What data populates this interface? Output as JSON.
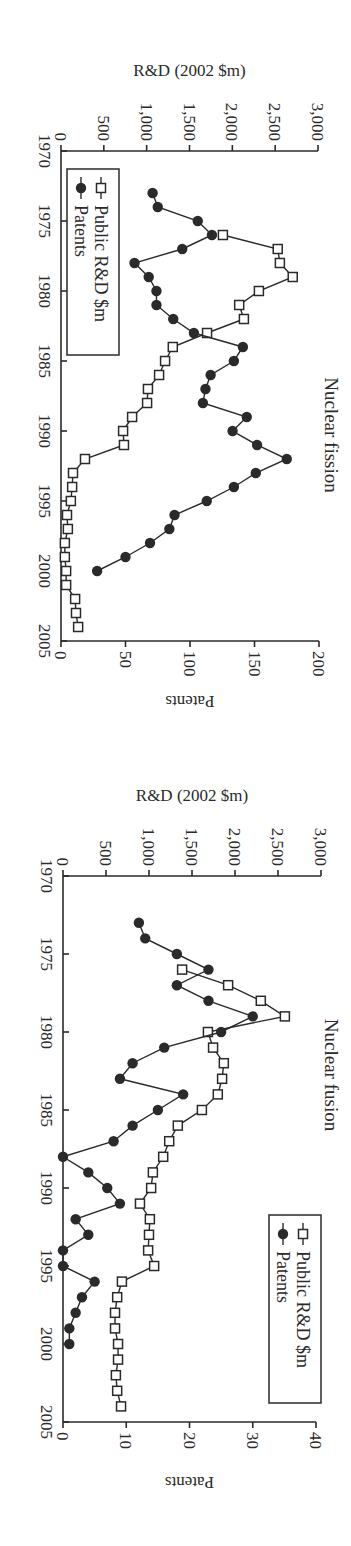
{
  "figure": {
    "panels": [
      "Nuclear fission",
      "Nuclear fusion"
    ]
  },
  "chart_data": [
    {
      "type": "line",
      "title": "Nuclear fission",
      "xlabel": "",
      "ylabel": "R&D (2002 $m)",
      "y2label": "Patents",
      "xlim": [
        1970,
        2005
      ],
      "ylim": [
        0,
        3000
      ],
      "y2lim": [
        0,
        200
      ],
      "xticks": [
        1970,
        1975,
        1980,
        1985,
        1990,
        1995,
        2000,
        2005
      ],
      "yticks": [
        0,
        500,
        1000,
        1500,
        2000,
        2500,
        3000
      ],
      "yticklabels": [
        "0",
        "500",
        "1,000",
        "1,500",
        "2,000",
        "2,500",
        "3,000"
      ],
      "y2ticks": [
        0,
        50,
        100,
        150,
        200
      ],
      "legend": [
        "Public R&D $m",
        "Patents"
      ],
      "legend_position": "lower-left",
      "grid": false,
      "series": [
        {
          "name": "Public R&D $m",
          "axis": "left",
          "marker": "open-square",
          "x": [
            1976,
            1977,
            1978,
            1979,
            1980,
            1981,
            1982,
            1983,
            1984,
            1985,
            1986,
            1987,
            1988,
            1989,
            1990,
            1991,
            1992,
            1993,
            1994,
            1995,
            1996,
            1997,
            1998,
            1999,
            2000,
            2001,
            2002,
            2003,
            2004
          ],
          "values": [
            1890,
            2530,
            2555,
            2705,
            2310,
            2080,
            2135,
            1705,
            1305,
            1215,
            1145,
            1015,
            1005,
            830,
            725,
            735,
            280,
            140,
            130,
            115,
            70,
            80,
            45,
            45,
            60,
            60,
            165,
            175,
            200
          ]
        },
        {
          "name": "Patents",
          "axis": "right",
          "marker": "filled-circle",
          "x": [
            1973,
            1974,
            1975,
            1976,
            1977,
            1978,
            1979,
            1980,
            1981,
            1982,
            1983,
            1984,
            1985,
            1986,
            1987,
            1988,
            1989,
            1990,
            1991,
            1992,
            1993,
            1994,
            1995,
            1996,
            1997,
            1998,
            1999,
            2000
          ],
          "values": [
            71,
            75,
            106,
            117,
            94,
            57,
            68,
            74,
            74,
            87,
            103,
            141,
            134,
            116,
            112,
            110,
            144,
            133,
            152,
            175,
            151,
            134,
            113,
            88,
            84,
            69,
            50,
            28
          ]
        }
      ]
    },
    {
      "type": "line",
      "title": "Nuclear fusion",
      "xlabel": "",
      "ylabel": "R&D (2002 $m)",
      "y2label": "Patents",
      "xlim": [
        1970,
        2005
      ],
      "ylim": [
        0,
        3000
      ],
      "y2lim": [
        0,
        40
      ],
      "xticks": [
        1970,
        1975,
        1980,
        1985,
        1990,
        1995,
        2000,
        2005
      ],
      "yticks": [
        0,
        500,
        1000,
        1500,
        2000,
        2500,
        3000
      ],
      "yticklabels": [
        "0",
        "500",
        "1,000",
        "1,500",
        "2,000",
        "2,500",
        "3,000"
      ],
      "y2ticks": [
        0,
        10,
        20,
        30,
        40
      ],
      "legend": [
        "Public R&D $m",
        "Patents"
      ],
      "legend_position": "upper-right",
      "grid": false,
      "series": [
        {
          "name": "Public R&D $m",
          "axis": "left",
          "marker": "open-square",
          "x": [
            1976,
            1977,
            1978,
            1979,
            1980,
            1981,
            1982,
            1983,
            1984,
            1985,
            1986,
            1987,
            1988,
            1989,
            1990,
            1991,
            1992,
            1993,
            1994,
            1995,
            1996,
            1997,
            1998,
            1999,
            2000,
            2001,
            2002,
            2003,
            2004
          ],
          "values": [
            1385,
            1920,
            2300,
            2580,
            1685,
            1745,
            1870,
            1850,
            1800,
            1615,
            1335,
            1235,
            1165,
            1045,
            1025,
            895,
            1010,
            1000,
            990,
            1060,
            685,
            630,
            605,
            605,
            640,
            640,
            615,
            630,
            675
          ]
        },
        {
          "name": "Patents",
          "axis": "right",
          "marker": "filled-circle",
          "x": [
            1973,
            1974,
            1975,
            1976,
            1977,
            1978,
            1979,
            1980,
            1981,
            1982,
            1983,
            1984,
            1985,
            1986,
            1987,
            1988,
            1989,
            1990,
            1991,
            1992,
            1993,
            1994,
            1995,
            1996,
            1997,
            1998,
            1999,
            2000
          ],
          "values": [
            12,
            13,
            18,
            23,
            18,
            23,
            30,
            25,
            16,
            11,
            9,
            19,
            15,
            11,
            8,
            0,
            4,
            7,
            9,
            2,
            4,
            0,
            0,
            5,
            3,
            2,
            1,
            1
          ]
        }
      ]
    }
  ]
}
